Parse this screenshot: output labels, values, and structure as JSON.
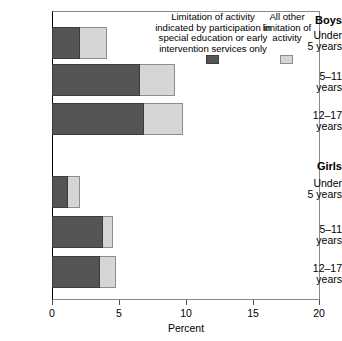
{
  "chart_data": {
    "type": "bar",
    "orientation": "horizontal",
    "stacked": true,
    "title": "",
    "xlabel": "Percent",
    "ylabel": "",
    "xlim": [
      0,
      20
    ],
    "xticks": [
      0,
      5,
      10,
      15,
      20
    ],
    "xtick_labels": [
      "0",
      "5",
      "10",
      "15",
      "20"
    ],
    "grid": false,
    "legend_position": "top-right-inside",
    "groups": [
      {
        "name": "Boys",
        "categories": [
          "Under\n5 years",
          "5–11\nyears",
          "12–17\nyears"
        ]
      },
      {
        "name": "Girls",
        "categories": [
          "Under\n5 years",
          "5–11\nyears",
          "12–17\nyears"
        ]
      }
    ],
    "categories": [
      "Boys Under 5 years",
      "Boys 5–11 years",
      "Boys 12–17 years",
      "Girls Under 5 years",
      "Girls 5–11 years",
      "Girls 12–17 years"
    ],
    "series": [
      {
        "name": "Limitation of activity indicated by participation in special education or early intervention services only",
        "color": "#555555",
        "values": [
          2.1,
          6.6,
          6.9,
          1.2,
          3.8,
          3.6
        ]
      },
      {
        "name": "All other limitation of activity",
        "color": "#d6d6d6",
        "values": [
          2.0,
          2.6,
          2.9,
          0.9,
          0.8,
          1.2
        ]
      }
    ],
    "totals": [
      4.1,
      9.2,
      9.8,
      2.1,
      4.6,
      4.8
    ]
  },
  "axis": {
    "x_label": "Percent",
    "ticks": [
      {
        "value": "0"
      },
      {
        "value": "5"
      },
      {
        "value": "10"
      },
      {
        "value": "15"
      },
      {
        "value": "20"
      }
    ]
  },
  "groups": {
    "boys": {
      "header": "Boys",
      "rows": [
        {
          "line1": "Under",
          "line2": "5 years",
          "dark": 2.1,
          "light": 2.0
        },
        {
          "line1": "5–11",
          "line2": "years",
          "dark": 6.6,
          "light": 2.6
        },
        {
          "line1": "12–17",
          "line2": "years",
          "dark": 6.9,
          "light": 2.9
        }
      ]
    },
    "girls": {
      "header": "Girls",
      "rows": [
        {
          "line1": "Under",
          "line2": "5 years",
          "dark": 1.2,
          "light": 0.9
        },
        {
          "line1": "5–11",
          "line2": "years",
          "dark": 3.8,
          "light": 0.8
        },
        {
          "line1": "12–17",
          "line2": "years",
          "dark": 3.6,
          "light": 1.2
        }
      ]
    }
  },
  "legend": {
    "dark": {
      "line1": "Limitation of activity",
      "line2": "indicated by participation in",
      "line3": "special education or early",
      "line4": "intervention services only",
      "color": "#555555"
    },
    "light": {
      "line1": "All other",
      "line2": "limitation of",
      "line3": "activity",
      "color": "#d6d6d6"
    }
  }
}
